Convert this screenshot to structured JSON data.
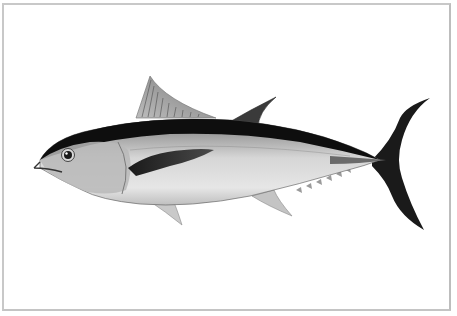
{
  "image": {
    "subject": "Tuna fish illustration",
    "description": "Scientific-style grayscale illustration of a tuna (albacore/bluefin type) facing left on a white background inside a thin gray frame",
    "background_color": "#ffffff",
    "frame_color": "#c8c8c8",
    "colors": {
      "dorsal_dark": "#111111",
      "body_light": "#d9d9d9",
      "belly": "#ececec",
      "tail": "#1a1a1a",
      "fin_gray": "#9a9a9a"
    }
  }
}
